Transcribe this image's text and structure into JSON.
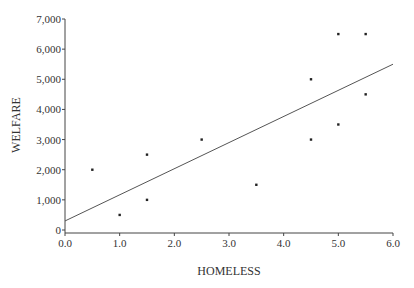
{
  "chart_data": {
    "type": "scatter",
    "title": "",
    "xlabel": "HOMELESS",
    "ylabel": "WELFARE",
    "xlim": [
      0,
      6
    ],
    "ylim": [
      0,
      7000
    ],
    "x_ticks": [
      "0.0",
      "1.0",
      "2.0",
      "3.0",
      "4.0",
      "5.0",
      "6.0"
    ],
    "y_ticks": [
      "0",
      "1,000",
      "2,000",
      "3,000",
      "4,000",
      "5,000",
      "6,000",
      "7,000"
    ],
    "grid": false,
    "legend": null,
    "series": [
      {
        "name": "observations",
        "points": [
          {
            "x": 0.5,
            "y": 2000
          },
          {
            "x": 1.0,
            "y": 500
          },
          {
            "x": 1.5,
            "y": 2500
          },
          {
            "x": 1.5,
            "y": 1000
          },
          {
            "x": 2.5,
            "y": 3000
          },
          {
            "x": 3.5,
            "y": 1500
          },
          {
            "x": 4.5,
            "y": 5000
          },
          {
            "x": 4.5,
            "y": 3000
          },
          {
            "x": 5.0,
            "y": 6500
          },
          {
            "x": 5.0,
            "y": 3500
          },
          {
            "x": 5.5,
            "y": 6500
          },
          {
            "x": 5.5,
            "y": 4500
          }
        ]
      }
    ],
    "fit_line": {
      "x0": 0,
      "y0": 300,
      "x1": 6,
      "y1": 5500
    }
  },
  "colors": {
    "axis": "#444444",
    "point": "#222222",
    "line": "#555555",
    "text": "#333333"
  }
}
